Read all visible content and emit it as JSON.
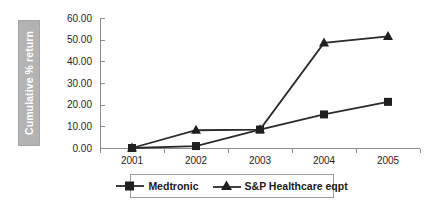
{
  "chart_data": {
    "type": "line",
    "title": "",
    "xlabel": "",
    "ylabel": "Cumulative % return",
    "categories": [
      "2001",
      "2002",
      "2003",
      "2004",
      "2005"
    ],
    "series": [
      {
        "name": "Medtronic",
        "marker": "square",
        "color": "#1f1f1f",
        "values": [
          0.0,
          0.9,
          8.5,
          15.5,
          21.3
        ]
      },
      {
        "name": "S&P Healthcare eqpt",
        "marker": "triangle",
        "color": "#1f1f1f",
        "values": [
          0.0,
          8.2,
          8.5,
          48.5,
          51.5
        ]
      }
    ],
    "ylim": [
      0,
      60
    ],
    "ytick_values": [
      0,
      10,
      20,
      30,
      40,
      50,
      60
    ],
    "ytick_labels": [
      "0.00",
      "10.00",
      "20.00",
      "30.00",
      "40.00",
      "50.00",
      "60.00"
    ],
    "grid": false,
    "legend_position": "bottom",
    "axis_color": "#8c8c8c",
    "ylabel_block_color": "#b3b3b3",
    "ylabel_text_color": "#ffffff"
  }
}
